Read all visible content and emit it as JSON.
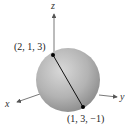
{
  "diagram": {
    "type": "3d-sphere-with-diameter",
    "axes": {
      "x_label": "x",
      "y_label": "y",
      "z_label": "z"
    },
    "points": [
      {
        "label": "(2, 1, 3)",
        "coords": [
          2,
          1,
          3
        ]
      },
      {
        "label": "(1, 3, −1)",
        "coords": [
          1,
          3,
          -1
        ]
      }
    ],
    "colors": {
      "sphere_light": "#d6d6d6",
      "sphere_dark": "#8e8e8e",
      "axis": "#555555",
      "segment": "#111111"
    }
  }
}
